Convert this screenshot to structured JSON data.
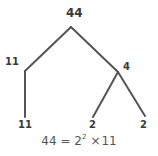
{
  "diagram": {
    "type": "factor-tree",
    "root": {
      "label": "44"
    },
    "level1": {
      "left": {
        "label": "11"
      },
      "right": {
        "label": "4"
      }
    },
    "leaves": {
      "left": {
        "label": "11"
      },
      "middle": {
        "label": "2"
      },
      "right": {
        "label": "2"
      }
    },
    "equation": {
      "lhs": "44",
      "equals": "=",
      "base": "2",
      "exponent": "2",
      "times": "×",
      "factor": "11"
    },
    "colors": {
      "line": "#555555",
      "text": "#3a3a3a",
      "background": "#ffffff"
    },
    "edges": [
      {
        "from": "44",
        "to": "11",
        "x1": 71,
        "y1": 27,
        "x2": 25,
        "y2": 71
      },
      {
        "from": "44",
        "to": "4",
        "x1": 71,
        "y1": 27,
        "x2": 118,
        "y2": 72
      },
      {
        "from": "11",
        "to": "11",
        "x1": 25,
        "y1": 71,
        "x2": 25,
        "y2": 117
      },
      {
        "from": "4",
        "to": "2",
        "x1": 118,
        "y1": 72,
        "x2": 93,
        "y2": 117
      },
      {
        "from": "4",
        "to": "2",
        "x1": 118,
        "y1": 72,
        "x2": 145,
        "y2": 116
      }
    ]
  }
}
